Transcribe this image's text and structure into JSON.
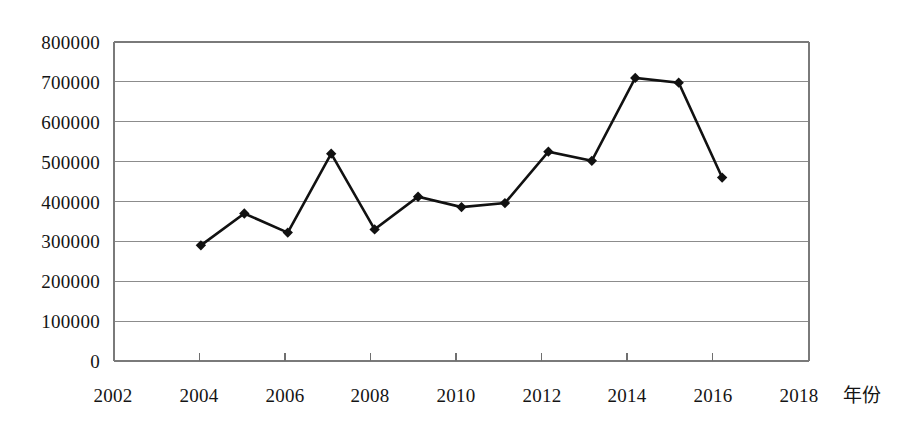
{
  "chart_data": {
    "type": "line",
    "title": "",
    "xlabel": "年份",
    "ylabel": "",
    "x": [
      2004,
      2005,
      2006,
      2007,
      2008,
      2009,
      2010,
      2011,
      2012,
      2013,
      2014,
      2015,
      2016
    ],
    "values": [
      290000,
      370000,
      322000,
      520000,
      330000,
      412000,
      386000,
      396000,
      525000,
      502000,
      710000,
      698000,
      460000
    ],
    "series": [
      {
        "name": "",
        "values": [
          290000,
          370000,
          322000,
          520000,
          330000,
          412000,
          386000,
          396000,
          525000,
          502000,
          710000,
          698000,
          460000
        ]
      }
    ],
    "xlim": [
      2002,
      2018
    ],
    "ylim": [
      0,
      800000
    ],
    "xticks": [
      2002,
      2004,
      2006,
      2008,
      2010,
      2012,
      2014,
      2016,
      2018
    ],
    "xtick_labels": [
      "2002",
      "2004",
      "2006",
      "2008",
      "2010",
      "2012",
      "2014",
      "2016",
      "2018"
    ],
    "yticks": [
      0,
      100000,
      200000,
      300000,
      400000,
      500000,
      600000,
      700000,
      800000
    ],
    "ytick_labels": [
      "0",
      "100000",
      "200000",
      "300000",
      "400000",
      "500000",
      "600000",
      "700000",
      "800000"
    ],
    "grid": "horizontal",
    "legend": "none",
    "marker": "diamond",
    "line_color": "#111111",
    "marker_color": "#111111",
    "grid_color": "#8c8c8c",
    "frame_color": "#7a7a7a",
    "background_color": "#ffffff"
  }
}
